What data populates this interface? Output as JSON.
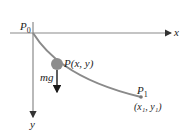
{
  "diagram": {
    "type": "brachistochrone-free-body",
    "labels": {
      "start_point": "P",
      "start_sub": "0",
      "end_point": "P",
      "end_sub": "1",
      "end_coords": "(x₁, y₁)",
      "bead_point": "P(x, y)",
      "force": "mg",
      "x_axis": "x",
      "y_axis": "y"
    },
    "colors": {
      "axis": "#8a8a8a",
      "curve": "#8a8a8a",
      "bead": "#8c8c8c",
      "force_arrow": "#1a1a1a",
      "text": "#222222"
    }
  }
}
